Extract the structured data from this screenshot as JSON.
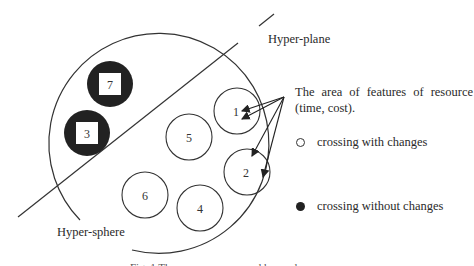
{
  "labels": {
    "hyperplane": "Hyper-plane",
    "hypersphere": "Hyper-sphere",
    "description": "The area of features of resource (time, cost)."
  },
  "legend": {
    "open": "crossing with changes",
    "filled": "crossing without changes"
  },
  "nodes": {
    "n1": "1",
    "n2": "2",
    "n3": "3",
    "n4": "4",
    "n5": "5",
    "n6": "6",
    "n7": "7"
  },
  "caption": "Fig. 1 The resource space and hyperplane"
}
